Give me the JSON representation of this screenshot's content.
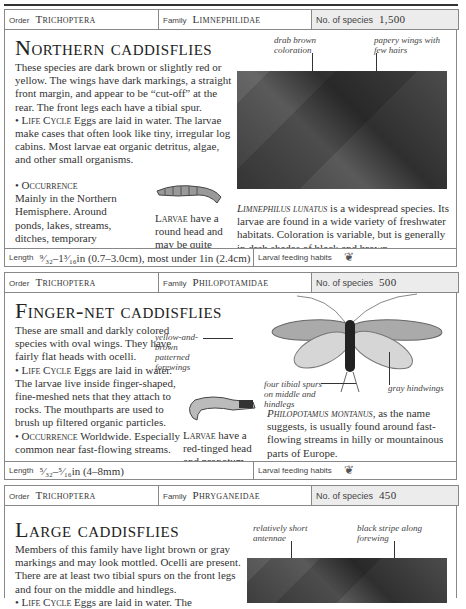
{
  "sections": [
    {
      "header": {
        "order_label": "Order",
        "order": "Trichoptera",
        "family_label": "Family",
        "family": "Limnephilidae",
        "species_label": "No. of species",
        "species_count": "1,500"
      },
      "title": "Northern caddisflies",
      "description": "These species are dark brown or slightly red or yellow. The wings have dark markings, a straight front margin, and appear to be “cut-off” at the rear. The front legs each have a tibial spur.",
      "life_cycle_label": "Life Cycle",
      "life_cycle": "Eggs are laid in water. The larvae make cases that often look like tiny, irregular log cabins. Most larvae eat organic detritus, algae, and other small organisms.",
      "occurrence_label": "Occurrence",
      "occurrence": "Mainly in the Northern Hemisphere. Around ponds, lakes, streams, ditches, temporary pools, and marshes.",
      "larvae_label": "Larvae",
      "larvae_text": "have a round head and may be quite large.",
      "annotations": [
        "drab brown coloration",
        "papery wings with few hairs"
      ],
      "species_name": "Limnephilus lunatus",
      "species_caption": "is a widespread species. Its larvae are found in a wide variety of freshwater habitats. Coloration is variable, but is generally in drab shades of black and brown.",
      "length_label": "Length",
      "length": "⁹⁄₃₂–1³⁄₁₆in (0.7–3.0cm), most under 1in (2.4cm)",
      "feeding_label": "Larval feeding habits",
      "feeding_icon": "leaf-icon"
    },
    {
      "header": {
        "order_label": "Order",
        "order": "Trichoptera",
        "family_label": "Family",
        "family": "Philopotamidae",
        "species_label": "No. of species",
        "species_count": "500"
      },
      "title": "Finger-net caddisflies",
      "description": "These are small and darkly colored species with oval wings. They have fairly flat heads with ocelli.",
      "life_cycle_label": "Life Cycle",
      "life_cycle": "Eggs are laid in water. The larvae live inside finger-shaped, fine-meshed nets that they attach to rocks. The mouthparts are used to brush up filtered organic particles.",
      "occurrence_label": "Occurrence",
      "occurrence": "Worldwide. Especially common near fast-flowing streams.",
      "larvae_label": "Larvae",
      "larvae_text": "have a red-tinged head and pronotum.",
      "annotations": [
        "yellow-and-brown patterned forewings",
        "four tibial spurs on middle and hindlegs",
        "gray hindwings"
      ],
      "species_name": "Philopotamus montanus",
      "species_caption": ", as the name suggests, is usually found around fast-flowing streams in hilly or mountainous parts of Europe.",
      "length_label": "Length",
      "length": "⁵⁄₃₂–⁵⁄₁₆in (4–8mm)",
      "feeding_label": "Larval feeding habits",
      "feeding_icon": "leaf-icon"
    },
    {
      "header": {
        "order_label": "Order",
        "order": "Trichoptera",
        "family_label": "Family",
        "family": "Phryganeidae",
        "species_label": "No. of species",
        "species_count": "450"
      },
      "title": "Large caddisflies",
      "description": "Members of this family have light brown or gray markings and may look mottled. Ocelli are present. There are at least two tibial spurs on the front legs and four on the middle and hindlegs.",
      "life_cycle_label": "Life Cycle",
      "life_cycle": "Eggs are laid in water. The",
      "annotations": [
        "relatively short antennae",
        "black stripe along forewing"
      ]
    }
  ]
}
